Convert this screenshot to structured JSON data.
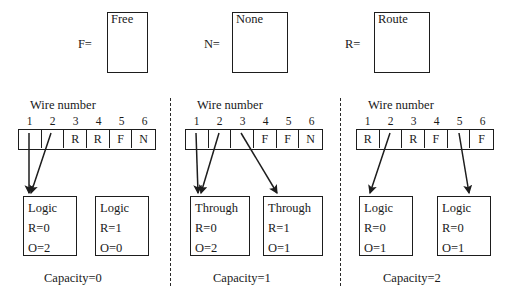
{
  "figure": {
    "panels": [
      {
        "id": "capacity-0",
        "var_label": "F=",
        "var_name": "Free",
        "wire_title": "Wire number",
        "wire_numbers": [
          "1",
          "2",
          "3",
          "4",
          "5",
          "6"
        ],
        "wire_cells": [
          "",
          "",
          "R",
          "R",
          "F",
          "N"
        ],
        "nodes": [
          {
            "title": "Logic",
            "r": "R=0",
            "o": "O=2"
          },
          {
            "title": "Logic",
            "r": "R=1",
            "o": "O=0"
          }
        ],
        "caption": "Capacity=0"
      },
      {
        "id": "capacity-1",
        "var_label": "N=",
        "var_name": "None",
        "wire_title": "Wire number",
        "wire_numbers": [
          "1",
          "2",
          "3",
          "4",
          "5",
          "6"
        ],
        "wire_cells": [
          "",
          "",
          "",
          "F",
          "F",
          "N"
        ],
        "nodes": [
          {
            "title": "Through",
            "r": "R=0",
            "o": "O=2"
          },
          {
            "title": "Through",
            "r": "R=1",
            "o": "O=1"
          }
        ],
        "caption": "Capacity=1"
      },
      {
        "id": "capacity-2",
        "var_label": "R=",
        "var_name": "Route",
        "wire_title": "Wire number",
        "wire_numbers": [
          "1",
          "2",
          "3",
          "4",
          "5",
          "6"
        ],
        "wire_cells": [
          "R",
          "",
          "R",
          "F",
          "",
          "F"
        ],
        "nodes": [
          {
            "title": "Logic",
            "r": "R=0",
            "o": "O=1"
          },
          {
            "title": "Logic",
            "r": "R=0",
            "o": "O=1"
          }
        ],
        "caption": "Capacity=2"
      }
    ],
    "colors": {
      "ink": "#1d1d1d",
      "background": "#ffffff"
    }
  }
}
